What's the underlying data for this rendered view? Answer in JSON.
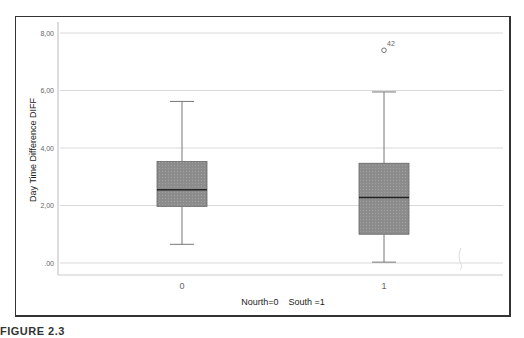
{
  "caption": "FIGURE 2.3",
  "chart_data": {
    "type": "boxplot",
    "title": "",
    "xlabel": "Nourth=0    South =1",
    "ylabel": "Day Time Difference DIFF",
    "ylim": [
      -0.4,
      8.4
    ],
    "yticks": [
      0,
      2,
      4,
      6,
      8
    ],
    "ytick_labels": [
      ".00",
      "2,00",
      "4,00",
      "6,00",
      "8,00"
    ],
    "grid": true,
    "categories": [
      "0",
      "1"
    ],
    "series": [
      {
        "name": "0",
        "whisker_low": 0.65,
        "q1": 1.97,
        "median": 2.55,
        "q3": 3.53,
        "whisker_high": 5.62,
        "outliers": []
      },
      {
        "name": "1",
        "whisker_low": 0.03,
        "q1": 1.0,
        "median": 2.28,
        "q3": 3.47,
        "whisker_high": 5.95,
        "outliers": [
          {
            "value": 7.4,
            "label": "42"
          }
        ]
      }
    ],
    "colors": {
      "box_fill": "#8c8c8c",
      "median": "#222222",
      "whisker": "#777777",
      "grid": "#d9d9d9"
    }
  }
}
